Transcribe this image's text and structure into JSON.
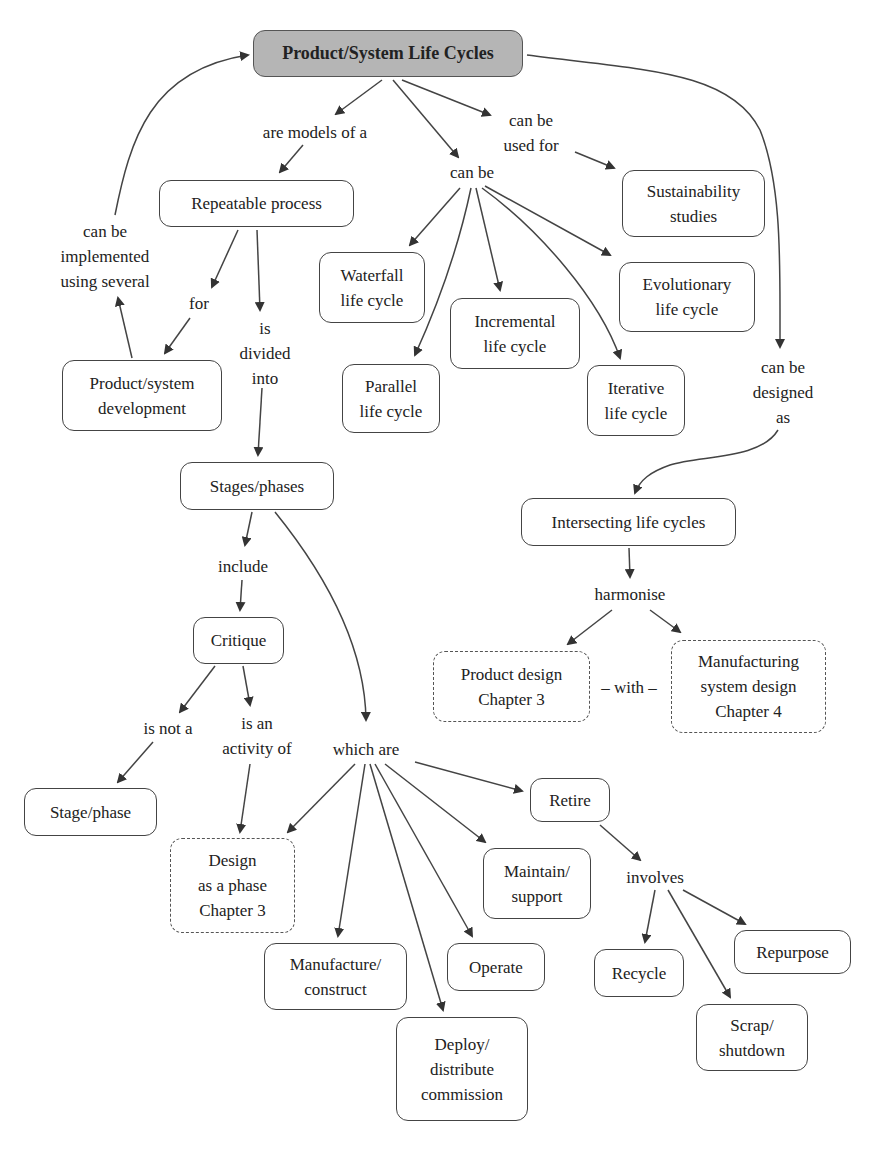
{
  "title": "Product/System Life Cycles",
  "colors": {
    "root_fill": "#b5b5b5",
    "stroke": "#444444",
    "arrow": "#333333"
  },
  "nodes": {
    "root": "Product/System Life Cycles",
    "repeatable_process": "Repeatable process",
    "product_system_development": "Product/system\ndevelopment",
    "waterfall": "Waterfall\nlife cycle",
    "parallel": "Parallel\nlife cycle",
    "incremental": "Incremental\nlife cycle",
    "iterative": "Iterative\nlife cycle",
    "evolutionary": "Evolutionary\nlife cycle",
    "sustainability": "Sustainability\nstudies",
    "stages_phases": "Stages/phases",
    "critique": "Critique",
    "stage_phase": "Stage/phase",
    "design_phase": "Design\nas a phase\nChapter 3",
    "manufacture": "Manufacture/\nconstruct",
    "deploy": "Deploy/\ndistribute\ncommission",
    "operate": "Operate",
    "maintain": "Maintain/\nsupport",
    "retire": "Retire",
    "recycle": "Recycle",
    "scrap": "Scrap/\nshutdown",
    "repurpose": "Repurpose",
    "intersecting": "Intersecting life cycles",
    "product_design": "Product design\nChapter 3",
    "manufacturing_system_design": "Manufacturing\nsystem design\nChapter 4"
  },
  "links": {
    "are_models_of_a": "are models of a",
    "can_be": "can be",
    "can_be_used_for": "can be\nused for",
    "can_be_implemented": "can be\nimplemented\nusing several",
    "for": "for",
    "is_divided_into": "is\ndivided\ninto",
    "can_be_designed_as": "can be\ndesigned\nas",
    "include": "include",
    "harmonise": "harmonise",
    "with": "– with –",
    "is_not_a": "is not a",
    "is_an_activity_of": "is an\nactivity of",
    "which_are": "which are",
    "involves": "involves"
  }
}
